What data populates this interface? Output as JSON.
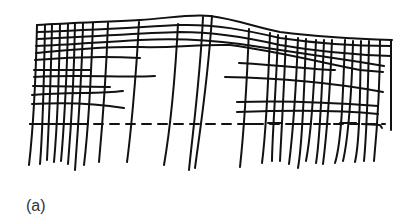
{
  "figure": {
    "caption": "(a)",
    "stroke_color": "#111111",
    "background_color": "#ffffff"
  }
}
